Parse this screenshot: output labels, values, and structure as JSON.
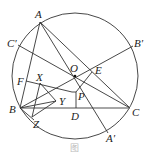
{
  "diagram": {
    "type": "geometry",
    "circle": {
      "cx": 75,
      "cy": 76,
      "r": 63
    },
    "points": {
      "A": {
        "label": "A",
        "x": 40,
        "y": 22
      },
      "B": {
        "label": "B",
        "x": 20,
        "y": 108
      },
      "C": {
        "label": "C",
        "x": 130,
        "y": 108
      },
      "O": {
        "label": "O",
        "x": 75,
        "y": 76
      },
      "E": {
        "label": "E",
        "x": 92,
        "y": 71
      },
      "P": {
        "label": "P",
        "x": 76,
        "y": 93
      },
      "D": {
        "label": "D",
        "x": 76,
        "y": 108
      },
      "F": {
        "label": "F",
        "x": 26,
        "y": 81
      },
      "X": {
        "label": "X",
        "x": 40,
        "y": 83
      },
      "Y": {
        "label": "Y",
        "x": 57,
        "y": 101
      },
      "Z": {
        "label": "Z",
        "x": 32,
        "y": 118
      },
      "A'": {
        "label": "A′",
        "x": 108,
        "y": 133
      },
      "B'": {
        "label": "B′",
        "x": 133,
        "y": 46
      },
      "C'": {
        "label": "C′",
        "x": 18,
        "y": 45
      }
    },
    "caption": "图"
  }
}
